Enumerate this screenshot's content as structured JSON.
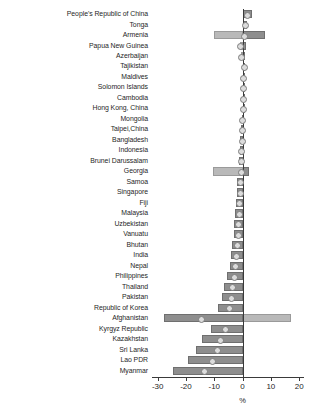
{
  "chart_data": {
    "type": "bar",
    "orientation": "horizontal",
    "title": "",
    "subtitle": "",
    "xlabel": "%",
    "ylabel": "",
    "xlim": [
      -32,
      21
    ],
    "xticks": [
      -30,
      -20,
      -10,
      0,
      10,
      20
    ],
    "xticklabels": [
      "-30",
      "-20",
      "-10",
      "0",
      "10",
      "20"
    ],
    "grid": false,
    "legend": "none",
    "zero_reference_line": true,
    "colors": {
      "series_dark": "#8e8e8e",
      "series_light": "#b9b9b9",
      "marker": "#dcdcdc",
      "axis": "#3a3a3a",
      "text": "#262626",
      "background": "#ffffff"
    },
    "categories": [
      "People's Republic of China",
      "Tonga",
      "Armenia",
      "Papua New Guinea",
      "Azerbaijan",
      "Tajikistan",
      "Maldives",
      "Solomon Islands",
      "Cambodia",
      "Hong Kong, China",
      "Mongolia",
      "Taipei,China",
      "Bangladesh",
      "Indonesia",
      "Brunei Darussalam",
      "Georgia",
      "Samoa",
      "Singapore",
      "Fiji",
      "Malaysia",
      "Uzbekistan",
      "Vanuatu",
      "Bhutan",
      "India",
      "Nepal",
      "Philippines",
      "Thailand",
      "Pakistan",
      "Republic of Korea",
      "Afghanistan",
      "Kyrgyz Republic",
      "Kazakhstan",
      "Sri Lanka",
      "Lao PDR",
      "Myanmar"
    ],
    "series": [
      {
        "name": "series-dark",
        "values": [
          3.2,
          1.6,
          8.0,
          1.2,
          1.0,
          0.5,
          0.4,
          0.3,
          0.2,
          0.1,
          -0.2,
          -0.6,
          -0.8,
          -1.0,
          -1.3,
          2.4,
          -1.8,
          -2.0,
          -2.3,
          -2.6,
          -2.9,
          -3.2,
          -3.6,
          -4.0,
          -4.6,
          -5.6,
          -6.4,
          -7.2,
          -8.6,
          -27.8,
          -11.2,
          -14.4,
          -16.4,
          -19.2,
          -24.6
        ]
      },
      {
        "name": "series-light",
        "values": [
          1.4,
          0.9,
          -10.2,
          -0.8,
          -0.6,
          0.3,
          0.2,
          0.2,
          0.1,
          0.1,
          -0.1,
          -0.3,
          -0.4,
          -0.5,
          -0.7,
          -10.4,
          -0.9,
          -1.0,
          -1.2,
          -1.4,
          -1.6,
          -1.8,
          -2.0,
          -2.2,
          -2.6,
          -3.2,
          -3.6,
          -4.0,
          -4.8,
          17.2,
          -6.2,
          -8.0,
          -9.2,
          -10.8,
          -13.8
        ]
      }
    ],
    "markers": {
      "name": "value-marker",
      "shape": "circle",
      "values": [
        1.4,
        0.9,
        0.4,
        -0.8,
        -0.6,
        0.3,
        0.2,
        0.2,
        0.1,
        0.1,
        -0.1,
        -0.3,
        -0.4,
        -0.5,
        -0.7,
        -0.6,
        -0.9,
        -1.0,
        -1.2,
        -1.4,
        -1.6,
        -1.8,
        -2.0,
        -2.2,
        -2.6,
        -3.2,
        -3.6,
        -4.0,
        -4.8,
        -14.6,
        -6.2,
        -8.0,
        -9.2,
        -10.8,
        -13.8
      ]
    }
  }
}
